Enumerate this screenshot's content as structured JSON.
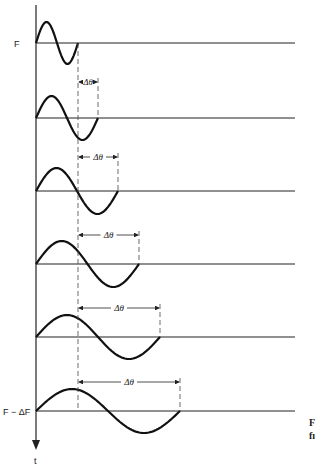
{
  "diagram": {
    "axis": {
      "top_label": "F",
      "bottom_label": "F − ΔF",
      "time_label": "t"
    },
    "delta_label": "Δθ",
    "caption_fragment": [
      "F",
      "fı"
    ],
    "colors": {
      "ink": "#222222",
      "background": "#ffffff"
    },
    "rows": [
      {
        "baseline_y": 43,
        "wave_end_x": 78,
        "amp": 21,
        "delta": false
      },
      {
        "baseline_y": 118,
        "wave_end_x": 98,
        "amp": 22,
        "delta": true,
        "arrow_y": 82
      },
      {
        "baseline_y": 191,
        "wave_end_x": 118,
        "amp": 23,
        "delta": true,
        "arrow_y": 157
      },
      {
        "baseline_y": 264,
        "wave_end_x": 139,
        "amp": 23,
        "delta": true,
        "arrow_y": 235
      },
      {
        "baseline_y": 337,
        "wave_end_x": 160,
        "amp": 22,
        "delta": true,
        "arrow_y": 308
      },
      {
        "baseline_y": 411,
        "wave_end_x": 180,
        "amp": 22,
        "delta": true,
        "arrow_y": 382
      }
    ]
  }
}
